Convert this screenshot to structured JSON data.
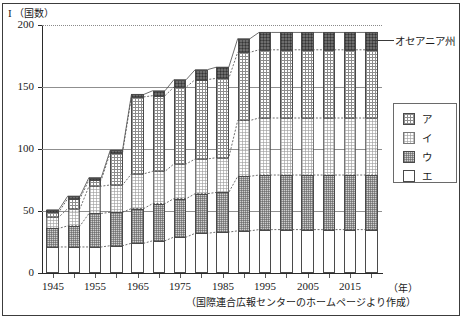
{
  "figure": {
    "label": "I",
    "unit": "（国数）",
    "source_note": "（国際連合広報センターのホームページより作成）",
    "annotation": "オセアニア州",
    "xaxis_unit": "（年）"
  },
  "legend": {
    "items": [
      {
        "key": "a",
        "label": "ア",
        "pattern": "grid-hatch"
      },
      {
        "key": "b",
        "label": "イ",
        "pattern": "light-dot"
      },
      {
        "key": "c",
        "label": "ウ",
        "pattern": "grey-checker"
      },
      {
        "key": "d",
        "label": "エ",
        "pattern": "white"
      }
    ]
  },
  "chart_data": {
    "type": "bar",
    "subtype": "stacked-bar-with-connectors",
    "title": "I （国数）",
    "xlabel": "（年）",
    "ylabel": "（国数）",
    "ylim": [
      0,
      200
    ],
    "yticks": [
      0,
      50,
      100,
      150,
      200
    ],
    "grid": true,
    "legend_position": "right",
    "categories": [
      1945,
      1950,
      1955,
      1960,
      1965,
      1970,
      1975,
      1980,
      1985,
      1990,
      1995,
      2000,
      2005,
      2010,
      2015,
      2020
    ],
    "tick_labels": [
      "1945",
      "1955",
      "1965",
      "1975",
      "1985",
      "1995",
      "2005",
      "2015"
    ],
    "series": [
      {
        "name": "エ",
        "key": "d",
        "pattern": "white",
        "values": [
          21,
          21,
          21,
          22,
          24,
          26,
          29,
          32,
          33,
          34,
          35,
          35,
          35,
          35,
          35,
          35
        ]
      },
      {
        "name": "ウ",
        "key": "c",
        "pattern": "grey-checker",
        "values": [
          15,
          17,
          27,
          27,
          28,
          30,
          31,
          32,
          32,
          44,
          44,
          44,
          44,
          44,
          44,
          44
        ]
      },
      {
        "name": "イ",
        "key": "b",
        "pattern": "light-dot",
        "values": [
          9,
          14,
          22,
          22,
          28,
          26,
          28,
          28,
          28,
          45,
          46,
          46,
          46,
          46,
          46,
          46
        ]
      },
      {
        "name": "ア",
        "key": "a",
        "pattern": "grid-hatch",
        "values": [
          4,
          8,
          5,
          26,
          62,
          61,
          62,
          64,
          64,
          55,
          55,
          55,
          55,
          55,
          55,
          55
        ]
      },
      {
        "name": "オセアニア州",
        "key": "oceania",
        "pattern": "dark",
        "values": [
          2,
          2,
          2,
          2,
          2,
          4,
          6,
          8,
          9,
          11,
          14,
          14,
          14,
          14,
          14,
          14
        ]
      }
    ],
    "totals": [
      51,
      60,
      76,
      99,
      117,
      127,
      144,
      154,
      159,
      159,
      185,
      189,
      191,
      192,
      193,
      193
    ]
  }
}
